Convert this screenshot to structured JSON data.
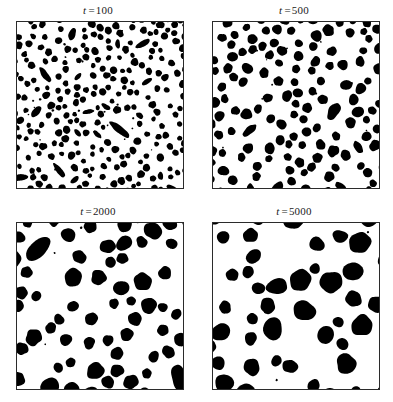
{
  "figure": {
    "type": "multi-panel-simulation-snapshot",
    "background_color": "#ffffff",
    "particle_color": "#000000",
    "frame_color": "#2b2b2b",
    "rows": 2,
    "columns": 2
  },
  "panels": [
    {
      "id": "panel-t100",
      "label_var": "t",
      "label_eq": "=",
      "label_value": "100",
      "time": 100,
      "seed": 1731,
      "blob_count": 250,
      "radius_min": 2.2,
      "radius_max": 3.8,
      "elongated_fraction": 0.16,
      "elongation_max": 3.2
    },
    {
      "id": "panel-t500",
      "label_var": "t",
      "label_eq": "=",
      "label_value": "500",
      "time": 500,
      "seed": 4409,
      "blob_count": 132,
      "radius_min": 3.4,
      "radius_max": 5.6,
      "elongated_fraction": 0.07,
      "elongation_max": 2.6
    },
    {
      "id": "panel-t2000",
      "label_var": "t",
      "label_eq": "=",
      "label_value": "2000",
      "time": 2000,
      "seed": 9127,
      "blob_count": 62,
      "radius_min": 4.5,
      "radius_max": 9.0,
      "elongated_fraction": 0.03,
      "elongation_max": 2.0
    },
    {
      "id": "panel-t5000",
      "label_var": "t",
      "label_eq": "=",
      "label_value": "5000",
      "time": 5000,
      "seed": 2255,
      "blob_count": 44,
      "radius_min": 5.0,
      "radius_max": 11.0,
      "elongated_fraction": 0.02,
      "elongation_max": 1.8
    }
  ],
  "chart_data": {
    "type": "scatter",
    "title": "",
    "xlabel": "",
    "ylabel": "",
    "categories": [
      "t = 100",
      "t = 500",
      "t = 2000",
      "t = 5000"
    ],
    "series": [
      {
        "name": "domain count",
        "values": [
          250,
          132,
          62,
          44
        ]
      },
      {
        "name": "mean domain radius (px)",
        "values": [
          3.0,
          4.5,
          6.8,
          8.0
        ]
      }
    ],
    "grid": false,
    "legend": "none",
    "panel_side_px": 166
  }
}
